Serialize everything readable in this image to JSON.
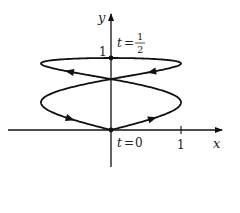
{
  "figure": {
    "type": "parametric-curve",
    "axes": {
      "x_label": "x",
      "y_label": "y",
      "x_tick": "1",
      "y_tick": "1"
    },
    "annotations": {
      "start": {
        "t_var": "t",
        "eq": "=",
        "value": "0"
      },
      "top": {
        "t_var": "t",
        "eq": "=",
        "num": "1",
        "den": "2"
      }
    },
    "curve": {
      "x_of_t": "sin(4πt)",
      "y_of_t": "sin(πt)",
      "t_range": [
        0,
        1
      ],
      "color": "#111111"
    },
    "points": [
      {
        "label": "t = 0",
        "x": 0,
        "y": 0
      },
      {
        "label": "t = 1/2",
        "x": 0,
        "y": 1
      }
    ]
  }
}
